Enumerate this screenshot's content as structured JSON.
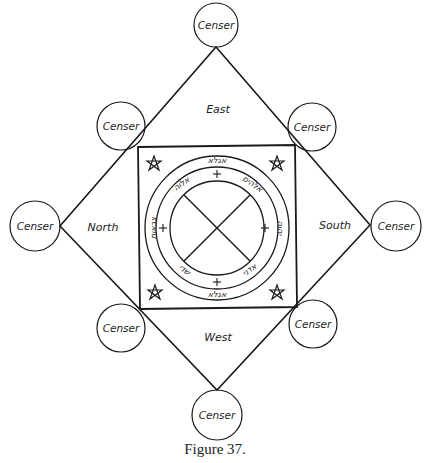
{
  "figure": {
    "caption": "Figure 37.",
    "directions": {
      "east": "East",
      "north": "North",
      "south": "South",
      "west": "West"
    },
    "censers": [
      {
        "position": "top",
        "label": "Censer"
      },
      {
        "position": "top-left",
        "label": "Censer"
      },
      {
        "position": "top-right",
        "label": "Censer"
      },
      {
        "position": "left",
        "label": "Censer"
      },
      {
        "position": "right",
        "label": "Censer"
      },
      {
        "position": "bottom-left",
        "label": "Censer"
      },
      {
        "position": "bottom-right",
        "label": "Censer"
      },
      {
        "position": "bottom",
        "label": "Censer"
      }
    ],
    "central_seal": {
      "rings": 3,
      "crosses": 4,
      "corner_pentagrams": 4,
      "inscription_symbols": {
        "top": "אגלא",
        "top_left": "אלוה",
        "top_right": "אלהים",
        "right": "יהוה",
        "bottom_right": "אדני",
        "bottom": "אגלא",
        "bottom_left": "שדי",
        "left": "צבאות"
      }
    }
  }
}
